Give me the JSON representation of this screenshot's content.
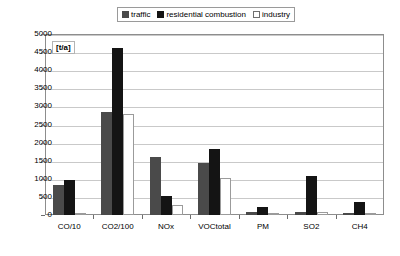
{
  "chart_data": {
    "type": "bar",
    "title": "",
    "subtitle": "",
    "xlabel": "",
    "ylabel": "[t/a]",
    "unit_label": "[t/a]",
    "ylim": [
      0,
      5000
    ],
    "grid": true,
    "legend_position": "top-center",
    "categories": [
      "CO/10",
      "CO2/100",
      "NOx",
      "VOCtotal",
      "PM",
      "SO2",
      "CH4"
    ],
    "y_ticks": [
      0,
      500,
      1000,
      1500,
      2000,
      2500,
      3000,
      3500,
      4000,
      4500,
      5000
    ],
    "y_tick_labels": [
      "0",
      "500",
      "1000",
      "1500",
      "2000",
      "2500",
      "3000",
      "3500",
      "4000",
      "4500",
      "5000"
    ],
    "series": [
      {
        "name": "traffic",
        "color": "#4a4a4a",
        "values": [
          820,
          2850,
          1600,
          1430,
          70,
          80,
          60
        ]
      },
      {
        "name": "residential combustion",
        "color": "#141414",
        "values": [
          970,
          4600,
          520,
          1820,
          210,
          1080,
          350
        ]
      },
      {
        "name": "industry",
        "color": "#ffffff",
        "values": [
          30,
          2800,
          290,
          1020,
          50,
          70,
          40
        ]
      }
    ]
  },
  "legend": {
    "entries": [
      {
        "label": "traffic",
        "swatch": "traffic-swatch"
      },
      {
        "label": "residential combustion",
        "swatch": "residential-combustion-swatch"
      },
      {
        "label": "industry",
        "swatch": "industry-swatch"
      }
    ]
  },
  "colors": {
    "traffic": "#4a4a4a",
    "residential_combustion": "#141414",
    "industry": "#ffffff",
    "industry_outline": "#9b9b9b",
    "gridline": "#c9c9c9",
    "frame": "#8d8d8d",
    "text": "#000000",
    "background": "#ffffff"
  }
}
